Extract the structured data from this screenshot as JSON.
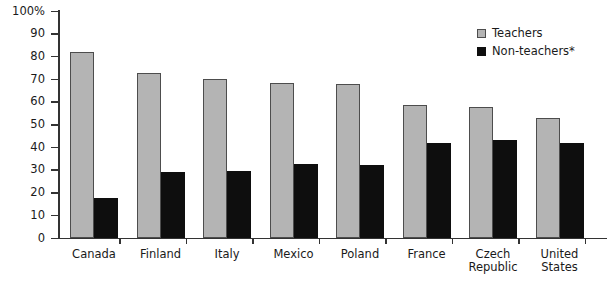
{
  "chart_data": {
    "type": "bar",
    "title": "",
    "subtitle": "",
    "xlabel": "",
    "ylabel": "",
    "ylim": [
      0,
      100
    ],
    "ytick_labels": [
      "100%",
      "90",
      "80",
      "70",
      "60",
      "50",
      "40",
      "30",
      "20",
      "10",
      "0"
    ],
    "ytick_values": [
      100,
      90,
      80,
      70,
      60,
      50,
      40,
      30,
      20,
      10,
      0
    ],
    "grid": false,
    "legend_position": "top-right",
    "categories": [
      "Canada",
      "Finland",
      "Italy",
      "Mexico",
      "Poland",
      "France",
      "Czech\nRepublic",
      "United\nStates"
    ],
    "series": [
      {
        "name": "Teachers",
        "color": "#b4b4b4",
        "values": [
          82,
          72.5,
          70,
          68.5,
          68,
          58.5,
          57.5,
          53
        ]
      },
      {
        "name": "Non-teachers*",
        "color": "#0e0e0e",
        "values": [
          17.5,
          29,
          29.5,
          32.5,
          32,
          42,
          43,
          42
        ]
      }
    ],
    "annotations": []
  },
  "legend": {
    "items": [
      {
        "label": "Teachers",
        "swatch": "teachers-swatch"
      },
      {
        "label": "Non-teachers*",
        "swatch": "non-teachers-swatch"
      }
    ]
  }
}
